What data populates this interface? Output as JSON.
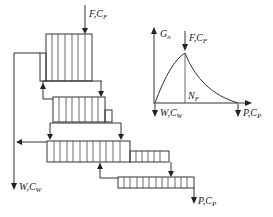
{
  "diagram": {
    "type": "cascade-extraction-schematic",
    "left_schematic": {
      "feed_label": "F,C",
      "feed_sub": "F",
      "waste_label": "W,C",
      "waste_sub": "W",
      "product_label": "P,C",
      "product_sub": "P",
      "stages": [
        {
          "name": "stage-1",
          "strips": 6
        },
        {
          "name": "stage-2",
          "strips": 8
        },
        {
          "name": "stage-3",
          "strips": 12
        },
        {
          "name": "stage-4",
          "strips": 12
        }
      ]
    },
    "right_plot": {
      "y_axis_label": "G",
      "y_axis_sub": "n",
      "feed_label": "F,C",
      "feed_sub": "F",
      "feed_position_label": "N",
      "feed_position_sub": "F",
      "waste_label": "W,C",
      "waste_sub": "W",
      "product_label": "P,C",
      "product_sub": "P"
    }
  }
}
